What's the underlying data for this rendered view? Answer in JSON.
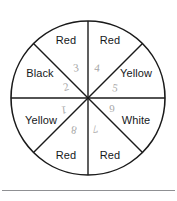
{
  "figure": {
    "type": "spinner-wheel",
    "title": "",
    "sector_count": 8,
    "center": {
      "x": 88,
      "y": 98
    },
    "radius": 77,
    "stroke_color": "#1a1a1a",
    "fill_color": "#ffffff",
    "label_color": "#16181a",
    "number_color": "#a8a8a8",
    "rule_color": "#8f9093",
    "sectors": [
      {
        "index": 1,
        "label": "Red",
        "number": "4",
        "label_x": 110,
        "label_y": 40,
        "number_x": 97,
        "number_y": 68,
        "num_class": "num-rot-d"
      },
      {
        "index": 2,
        "label": "Yellow",
        "number": "5",
        "label_x": 136,
        "label_y": 73,
        "number_x": 115,
        "number_y": 88,
        "num_class": "num-rot-b"
      },
      {
        "index": 3,
        "label": "White",
        "number": "6",
        "label_x": 136,
        "label_y": 120,
        "number_x": 112,
        "number_y": 108,
        "num_class": "num-rot-e"
      },
      {
        "index": 4,
        "label": "Red",
        "number": "7",
        "label_x": 110,
        "label_y": 155,
        "number_x": 95,
        "number_y": 129,
        "num_class": "num-rot-f"
      },
      {
        "index": 5,
        "label": "Red",
        "number": "8",
        "label_x": 66,
        "label_y": 155,
        "number_x": 74,
        "number_y": 130,
        "num_class": "num-rot-g"
      },
      {
        "index": 6,
        "label": "Yellow",
        "number": "1",
        "label_x": 41,
        "label_y": 120,
        "number_x": 64,
        "number_y": 110,
        "num_class": "num-rot-h"
      },
      {
        "index": 7,
        "label": "Black",
        "number": "2",
        "label_x": 40,
        "label_y": 73,
        "number_x": 66,
        "number_y": 87,
        "num_class": "num-rot-c"
      },
      {
        "index": 8,
        "label": "Red",
        "number": "3",
        "label_x": 66,
        "label_y": 40,
        "number_x": 76,
        "number_y": 68,
        "num_class": "num-rot-a"
      }
    ],
    "bottom_rule": {
      "visible": true,
      "x": 2,
      "y": 190,
      "width": 173
    }
  }
}
